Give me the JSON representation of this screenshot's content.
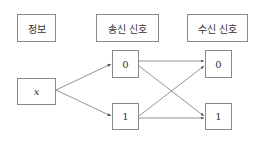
{
  "headers": {
    "info": "정보",
    "sent": "송신 신호",
    "received": "수신 신호"
  },
  "nodes": {
    "source": "x",
    "sent": [
      "0",
      "1"
    ],
    "received": [
      "0",
      "1"
    ]
  },
  "edges": [
    {
      "from": "x",
      "to": "sent-0"
    },
    {
      "from": "x",
      "to": "sent-1"
    },
    {
      "from": "sent-0",
      "to": "received-0"
    },
    {
      "from": "sent-0",
      "to": "received-1"
    },
    {
      "from": "sent-1",
      "to": "received-0"
    },
    {
      "from": "sent-1",
      "to": "received-1"
    }
  ]
}
